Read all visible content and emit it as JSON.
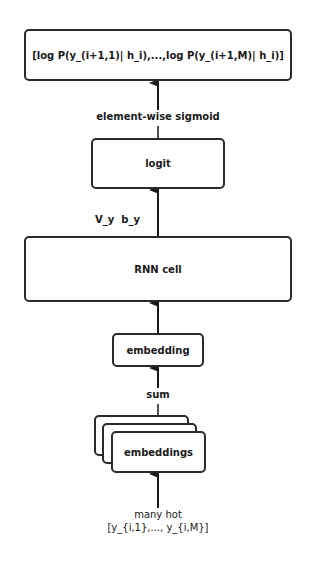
{
  "diagram": {
    "output_box": {
      "label": "[log P(y_(i+1,1)| h_i),...,log P(y_(i+1,M)| h_i)]"
    },
    "sigmoid_label": "element-wise sigmoid",
    "logit_box": {
      "label": "logit"
    },
    "params_label": "V_y  b_y",
    "rnn_box": {
      "label": "RNN cell"
    },
    "embedding_box": {
      "label": "embedding"
    },
    "sum_label": "sum",
    "embeddings_box": {
      "label": "embeddings"
    },
    "input_label_line1": "many hot",
    "input_label_line2": "[y_{i,1},..., y_{i,M}]"
  }
}
